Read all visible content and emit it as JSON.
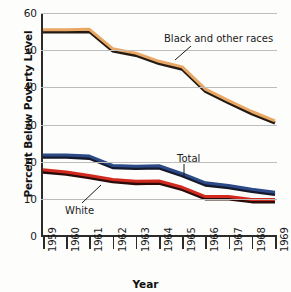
{
  "chart_data": {
    "type": "line",
    "title": "",
    "xlabel": "Year",
    "ylabel": "Percent Below Poverty Level",
    "xlim": [
      1959,
      1969
    ],
    "ylim": [
      0,
      60
    ],
    "yticks": [
      0,
      10,
      20,
      30,
      40,
      50,
      60
    ],
    "grid": true,
    "legend_position": "inline-annotations",
    "categories": [
      "1959",
      "1960",
      "1961",
      "1962",
      "1963",
      "1964",
      "1965",
      "1966",
      "1967",
      "1968",
      "1969"
    ],
    "x": [
      1959,
      1960,
      1961,
      1962,
      1963,
      1964,
      1965,
      1966,
      1967,
      1968,
      1969
    ],
    "series": [
      {
        "name": "Black and other races",
        "color": "#E8A765",
        "edge_color": "#241a12",
        "values": [
          55.5,
          55.5,
          55.6,
          50.4,
          49.2,
          47.0,
          45.5,
          39.5,
          36.4,
          33.5,
          31.0
        ]
      },
      {
        "name": "Total",
        "color": "#2C4A87",
        "edge_color": "#14192c",
        "values": [
          21.8,
          21.8,
          21.5,
          19.0,
          18.8,
          18.9,
          16.8,
          14.3,
          13.6,
          12.6,
          11.8
        ]
      },
      {
        "name": "White",
        "color": "#D32A20",
        "edge_color": "#2a0c08",
        "values": [
          17.8,
          17.2,
          16.3,
          15.2,
          14.7,
          14.8,
          13.1,
          10.6,
          10.6,
          9.8,
          9.8
        ]
      }
    ],
    "annotations": [
      {
        "text": "Black and other races",
        "target_series": "Black and other races"
      },
      {
        "text": "Total",
        "target_series": "Total"
      },
      {
        "text": "White",
        "target_series": "White"
      }
    ]
  }
}
